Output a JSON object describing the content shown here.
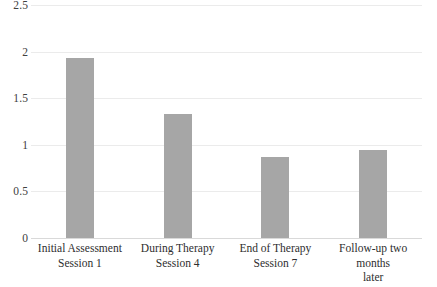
{
  "chart_data": {
    "type": "bar",
    "title": "",
    "subtitle": "",
    "xlabel": "",
    "ylabel": "",
    "ylim": [
      0,
      2.5
    ],
    "ytick_labels": [
      "2.5",
      "2",
      "1.5",
      "1",
      "0.5",
      "0"
    ],
    "ytick_values": [
      2.5,
      2,
      1.5,
      1,
      0.5,
      0
    ],
    "grid": true,
    "grid_axis": "y",
    "legend": false,
    "legend_position": "none",
    "bar_color": "#a6a6a6",
    "gridline_color": "#ebebeb",
    "axis_color": "#d9d9d9",
    "text_color": "#2e2e2e",
    "categories": [
      "Initial Assessment Session 1",
      "During Therapy Session 4",
      "End of Therapy Session 7",
      "Follow-up two months later"
    ],
    "category_lines": [
      [
        "Initial Assessment",
        "Session 1"
      ],
      [
        "During Therapy",
        "Session 4"
      ],
      [
        "End of Therapy",
        "Session 7"
      ],
      [
        "Follow-up two months",
        "later"
      ]
    ],
    "values": [
      1.93,
      1.33,
      0.87,
      0.94
    ]
  }
}
